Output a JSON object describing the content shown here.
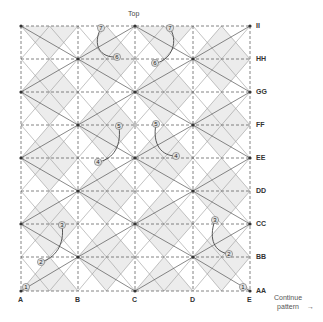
{
  "top_label": "Top",
  "columns": [
    "A",
    "B",
    "C",
    "D",
    "E"
  ],
  "rows": [
    "II",
    "HH",
    "GG",
    "FF",
    "EE",
    "DD",
    "CC",
    "BB",
    "AA"
  ],
  "continue": {
    "line1": "Continue",
    "line2": "pattern"
  },
  "markers": [
    {
      "n": "1",
      "x": 26,
      "y": 287
    },
    {
      "n": "2",
      "x": 41,
      "y": 262
    },
    {
      "n": "3",
      "x": 62,
      "y": 225
    },
    {
      "n": "4",
      "x": 98,
      "y": 162
    },
    {
      "n": "5",
      "x": 119,
      "y": 126
    },
    {
      "n": "6",
      "x": 117,
      "y": 57
    },
    {
      "n": "7",
      "x": 101,
      "y": 28
    },
    {
      "n": "1",
      "x": 243,
      "y": 287
    },
    {
      "n": "2",
      "x": 229,
      "y": 254
    },
    {
      "n": "3",
      "x": 215,
      "y": 220
    },
    {
      "n": "4",
      "x": 176,
      "y": 156
    },
    {
      "n": "5",
      "x": 156,
      "y": 124
    },
    {
      "n": "6",
      "x": 155,
      "y": 63
    },
    {
      "n": "7",
      "x": 170,
      "y": 28
    }
  ],
  "colors": {
    "shade": "#ececec",
    "dark": "#555555",
    "light": "#9a9a9a",
    "grid": "#666666"
  }
}
